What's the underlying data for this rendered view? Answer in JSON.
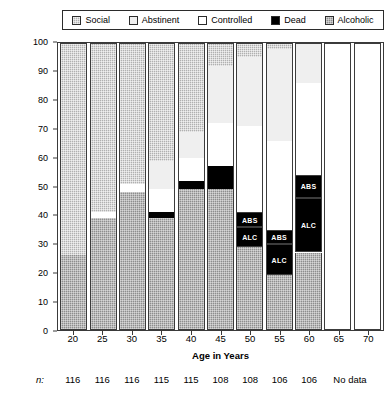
{
  "legend": {
    "items": [
      {
        "label": "Social",
        "key": "social",
        "color": "#b0b0b0"
      },
      {
        "label": "Abstinent",
        "key": "abstinent",
        "color": "#efefef"
      },
      {
        "label": "Controlled",
        "key": "controlled",
        "color": "#ffffff"
      },
      {
        "label": "Dead",
        "key": "dead",
        "color": "#000000"
      },
      {
        "label": "Alcoholic",
        "key": "alcoholic",
        "color": "#8e8e8e"
      }
    ]
  },
  "axes": {
    "ylabel": "Percent Alcohol Abusers (Core City Sample)",
    "xlabel": "Age in Years",
    "yticks": [
      0,
      10,
      20,
      30,
      40,
      50,
      60,
      70,
      80,
      90,
      100
    ],
    "ylim": [
      0,
      100
    ],
    "xticks": [
      "20",
      "25",
      "30",
      "35",
      "40",
      "45",
      "50",
      "55",
      "60",
      "65",
      "70"
    ]
  },
  "footer": {
    "n_prefix": "n:",
    "n_values": [
      "116",
      "116",
      "116",
      "115",
      "115",
      "108",
      "108",
      "106",
      "106",
      "",
      ""
    ],
    "no_data_label": "No data"
  },
  "chart_data": {
    "type": "bar",
    "title": "",
    "subtitle": "",
    "stacked": true,
    "xlabel": "Age in Years",
    "ylabel": "Percent Alcohol Abusers (Core City Sample)",
    "ylim": [
      0,
      100
    ],
    "grid": false,
    "legend_position": "top",
    "categories": [
      "20",
      "25",
      "30",
      "35",
      "40",
      "45",
      "50",
      "55",
      "60",
      "65",
      "70"
    ],
    "sample_sizes": [
      116,
      116,
      116,
      115,
      115,
      108,
      108,
      106,
      106,
      null,
      null
    ],
    "series": [
      {
        "name": "Social",
        "values": [
          74,
          59,
          49,
          41,
          31,
          8,
          5,
          2,
          0,
          null,
          null
        ]
      },
      {
        "name": "Abstinent",
        "values": [
          0,
          0,
          0,
          10,
          9,
          20,
          24,
          32,
          14,
          null,
          null
        ]
      },
      {
        "name": "Controlled",
        "values": [
          0,
          2,
          3,
          8,
          8,
          15,
          30,
          31,
          32,
          null,
          null
        ]
      },
      {
        "name": "Dead",
        "values": [
          0,
          0,
          0,
          2,
          3,
          8,
          12,
          16,
          27,
          null,
          null
        ]
      },
      {
        "name": "Alcoholic",
        "values": [
          26,
          39,
          48,
          39,
          49,
          49,
          29,
          19,
          27,
          null,
          null
        ]
      }
    ],
    "inline_labels": {
      "abstinent_dead": "ABS",
      "alcoholic_dead": "ALC"
    }
  },
  "bars": [
    {
      "age": "20",
      "empty": false,
      "segments": [
        {
          "key": "social",
          "label": "",
          "pct": 74
        },
        {
          "key": "alcoholic",
          "label": "",
          "pct": 26
        }
      ]
    },
    {
      "age": "25",
      "empty": false,
      "segments": [
        {
          "key": "social",
          "label": "",
          "pct": 59
        },
        {
          "key": "controlled",
          "label": "",
          "pct": 2
        },
        {
          "key": "alcoholic",
          "label": "",
          "pct": 39
        }
      ]
    },
    {
      "age": "30",
      "empty": false,
      "segments": [
        {
          "key": "social",
          "label": "",
          "pct": 49
        },
        {
          "key": "controlled",
          "label": "",
          "pct": 3
        },
        {
          "key": "alcoholic",
          "label": "",
          "pct": 48
        }
      ]
    },
    {
      "age": "35",
      "empty": false,
      "segments": [
        {
          "key": "social",
          "label": "",
          "pct": 41
        },
        {
          "key": "abstinent",
          "label": "",
          "pct": 10
        },
        {
          "key": "controlled",
          "label": "",
          "pct": 8
        },
        {
          "key": "dead",
          "label": "",
          "pct": 2
        },
        {
          "key": "alcoholic",
          "label": "",
          "pct": 39
        }
      ]
    },
    {
      "age": "40",
      "empty": false,
      "segments": [
        {
          "key": "social",
          "label": "",
          "pct": 31
        },
        {
          "key": "abstinent",
          "label": "",
          "pct": 9
        },
        {
          "key": "controlled",
          "label": "",
          "pct": 8
        },
        {
          "key": "dead",
          "label": "",
          "pct": 3
        },
        {
          "key": "alcoholic",
          "label": "",
          "pct": 49
        }
      ]
    },
    {
      "age": "45",
      "empty": false,
      "segments": [
        {
          "key": "social",
          "label": "",
          "pct": 8
        },
        {
          "key": "abstinent",
          "label": "",
          "pct": 20
        },
        {
          "key": "controlled",
          "label": "",
          "pct": 15
        },
        {
          "key": "dead",
          "label": "",
          "pct": 8
        },
        {
          "key": "alcoholic",
          "label": "",
          "pct": 49
        }
      ]
    },
    {
      "age": "50",
      "empty": false,
      "segments": [
        {
          "key": "social",
          "label": "",
          "pct": 5
        },
        {
          "key": "abstinent",
          "label": "",
          "pct": 24
        },
        {
          "key": "controlled",
          "label": "",
          "pct": 30
        },
        {
          "key": "dead",
          "label": "ABS",
          "pct": 5
        },
        {
          "key": "dead",
          "label": "ALC",
          "pct": 7
        },
        {
          "key": "alcoholic",
          "label": "",
          "pct": 29
        }
      ]
    },
    {
      "age": "55",
      "empty": false,
      "segments": [
        {
          "key": "social",
          "label": "",
          "pct": 2
        },
        {
          "key": "abstinent",
          "label": "",
          "pct": 32
        },
        {
          "key": "controlled",
          "label": "",
          "pct": 31
        },
        {
          "key": "dead",
          "label": "ABS",
          "pct": 5
        },
        {
          "key": "dead",
          "label": "ALC",
          "pct": 11
        },
        {
          "key": "alcoholic",
          "label": "",
          "pct": 19
        }
      ]
    },
    {
      "age": "60",
      "empty": false,
      "segments": [
        {
          "key": "abstinent",
          "label": "",
          "pct": 14
        },
        {
          "key": "controlled",
          "label": "",
          "pct": 32
        },
        {
          "key": "dead",
          "label": "ABS",
          "pct": 8
        },
        {
          "key": "dead",
          "label": "ALC",
          "pct": 19
        },
        {
          "key": "alcoholic",
          "label": "",
          "pct": 27
        }
      ]
    },
    {
      "age": "65",
      "empty": true,
      "segments": []
    },
    {
      "age": "70",
      "empty": true,
      "segments": []
    }
  ]
}
